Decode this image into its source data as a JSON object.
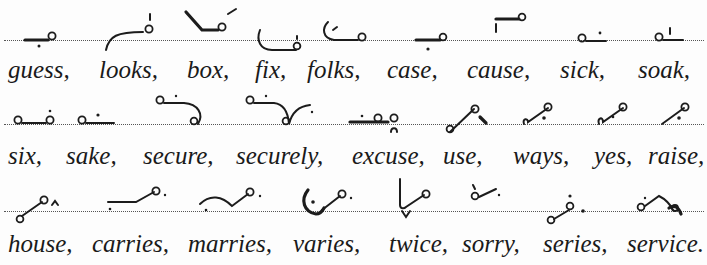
{
  "document": {
    "type": "shorthand exercise",
    "rows": [
      {
        "words": [
          "guess,",
          "looks,",
          "box,",
          "fix,",
          "folks,",
          "case,",
          "cause,",
          "sick,",
          "soak,"
        ],
        "word_x": [
          8,
          99,
          187,
          255,
          307,
          387,
          467,
          560,
          638
        ]
      },
      {
        "words": [
          "six,",
          "sake,",
          "secure,",
          "securely,",
          "excuse,",
          "use,",
          "ways,",
          "yes,",
          "raise,"
        ],
        "word_x": [
          8,
          66,
          143,
          236,
          352,
          443,
          513,
          594,
          648
        ]
      },
      {
        "words": [
          "house,",
          "carries,",
          "marries,",
          "varies,",
          "twice,",
          "sorry,",
          "series,",
          "service."
        ],
        "word_x": [
          8,
          92,
          188,
          293,
          389,
          462,
          543,
          627
        ]
      }
    ]
  },
  "colors": {
    "ink": "#1c1c1c",
    "paper": "#fdfdfd",
    "rule": "#555555"
  }
}
